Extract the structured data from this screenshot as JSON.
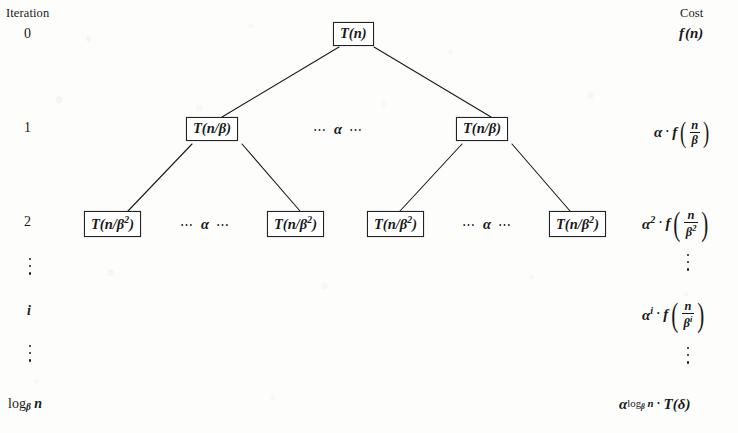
{
  "headers": {
    "iteration": "Iteration",
    "cost": "Cost"
  },
  "rows": [
    {
      "iteration_label": "0",
      "nodes": [
        "T(n)"
      ],
      "separators": [],
      "cost": "f(n)"
    },
    {
      "iteration_label": "1",
      "nodes": [
        "T(n/β)",
        "T(n/β)"
      ],
      "separators": [
        "⋯ α ⋯"
      ],
      "cost": "α · f(n/β)"
    },
    {
      "iteration_label": "2",
      "nodes": [
        "T(n/β²)",
        "T(n/β²)",
        "T(n/β²)",
        "T(n/β²)"
      ],
      "separators": [
        "⋯ α ⋯",
        "⋯ α ⋯"
      ],
      "cost": "α² · f(n/β²)"
    },
    {
      "iteration_label": "i",
      "nodes": [],
      "separators": [],
      "cost": "αⁱ · f(n/βⁱ)"
    },
    {
      "iteration_label": "logβ n",
      "nodes": [],
      "separators": [],
      "cost": "α^(logβ n) · T(δ)"
    }
  ],
  "symbols": {
    "T": "T",
    "f": "f",
    "n": "n",
    "alpha": "α",
    "beta": "β",
    "delta": "δ",
    "i": "i",
    "log": "log",
    "dot_operator": "·",
    "hdots": "⋯",
    "vdots": "⋮",
    "exp_two": "2",
    "iter_zero": "0",
    "iter_one": "1",
    "iter_two": "2"
  },
  "colors": {
    "background": "#fdfdfc",
    "ink": "#1a1a1a",
    "box_border": "#222222"
  }
}
